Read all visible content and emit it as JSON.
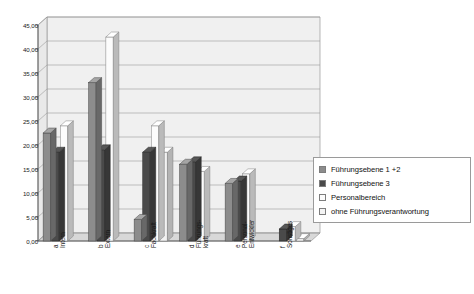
{
  "chart_data": {
    "type": "bar",
    "title": "",
    "subtitle": "",
    "xlabel": "",
    "ylabel": "",
    "ylim": [
      0.0,
      45.0
    ],
    "ytick_step": 5.0,
    "ytick_labels": [
      "45,00",
      "40,00",
      "35,00",
      "30,00",
      "25,00",
      "20,00",
      "15,00",
      "10,00",
      "5,00",
      "0,00"
    ],
    "ytick_values": [
      45.0,
      40.0,
      35.0,
      30.0,
      25.0,
      20.0,
      15.0,
      10.0,
      5.0,
      0.0
    ],
    "grid": true,
    "style": "3d-column",
    "legend_position": "right",
    "categories": [
      {
        "key": "a",
        "line1": "a",
        "line2": "Intern"
      },
      {
        "key": "b",
        "line1": "b",
        "line2": "Extern"
      },
      {
        "key": "c",
        "line1": "c",
        "line2": "Fachkraft"
      },
      {
        "key": "d",
        "line1": "d",
        "line2": "Führungs-",
        "line3": "kraft"
      },
      {
        "key": "e",
        "line1": "e",
        "line2": "Personal-",
        "line3": "Entwickler"
      },
      {
        "key": "f",
        "line1": "f",
        "line2": "Sonstiges"
      }
    ],
    "series": [
      {
        "name": "Führungsebene 1 +2",
        "color": "#8c8c8c",
        "values": [
          22.5,
          33.0,
          4.5,
          16.0,
          12.0,
          0.0
        ]
      },
      {
        "name": "Führungsebene 3",
        "color": "#4a4a4a",
        "values": [
          18.5,
          19.0,
          18.5,
          16.5,
          12.5,
          2.5
        ]
      },
      {
        "name": "Personalbereich",
        "color": "#fcfcfc",
        "values": [
          24.0,
          42.5,
          24.0,
          14.5,
          14.0,
          3.0
        ]
      },
      {
        "name": "ohne Führungsverantwortung",
        "color": "#f2f2f2",
        "values": [
          0.0,
          0.0,
          18.5,
          0.0,
          0.0,
          0.5
        ]
      }
    ]
  },
  "legend": {
    "items": [
      {
        "label": "Führungsebene 1 +2",
        "swatch": "#8c8c8c"
      },
      {
        "label": "Führungsebene 3",
        "swatch": "#4a4a4a"
      },
      {
        "label": "Personalbereich",
        "swatch": "#fcfcfc"
      },
      {
        "label": "ohne Führungsverantwortung",
        "swatch": "#f4f4f4"
      }
    ]
  },
  "colors": {
    "plot_background": "#f0f0f0",
    "grid_line": "#9a9a9a",
    "axis_line": "#555555",
    "text": "#1a1a1a",
    "floor": "#d8d8d8"
  }
}
